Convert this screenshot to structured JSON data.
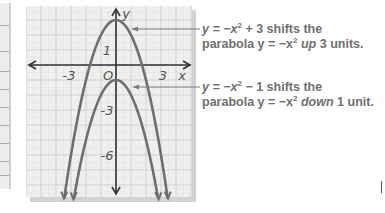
{
  "figure": {
    "axis_labels": {
      "x": "x",
      "y": "y"
    },
    "x_ticks": [
      {
        "value": -3,
        "label": "-3"
      },
      {
        "value": 0,
        "label": "O"
      },
      {
        "value": 3,
        "label": "3"
      }
    ],
    "y_ticks": [
      {
        "value": 1,
        "label": "1"
      },
      {
        "value": -3,
        "label": "-3"
      },
      {
        "value": -6,
        "label": "-6"
      }
    ],
    "colors": {
      "curve": "#6e6e6e",
      "axis": "#333333",
      "grid": "#d4d4d4",
      "grid_bg": "#efefef",
      "text": "#707070"
    }
  },
  "captions": [
    {
      "line1_pre": "y = −x",
      "line1_exp": "2",
      "line1_post": " + 3 shifts the",
      "line2_pre": "parabola y = −x",
      "line2_exp": "2",
      "line2_em": "up",
      "line2_post": " 3 units."
    },
    {
      "line1_pre": "y = −x",
      "line1_exp": "2",
      "line1_post": " − 1 shifts the",
      "line2_pre": "parabola y = −x",
      "line2_exp": "2",
      "line2_em": "down",
      "line2_post": " 1 unit."
    }
  ],
  "chart_data": {
    "type": "line",
    "title": "",
    "xlabel": "x",
    "ylabel": "y",
    "xlim": [
      -6,
      5
    ],
    "ylim": [
      -9,
      4
    ],
    "grid": true,
    "series": [
      {
        "name": "y = -x^2 + 3",
        "x": [
          -3.4,
          -3,
          -2,
          -1,
          0,
          1,
          2,
          3,
          3.4
        ],
        "y": [
          -8.56,
          -6,
          -1,
          2,
          3,
          2,
          -1,
          -6,
          -8.56
        ]
      },
      {
        "name": "y = -x^2 - 1",
        "x": [
          -2.8,
          -2,
          -1,
          0,
          1,
          2,
          2.8
        ],
        "y": [
          -8.84,
          -5,
          -2,
          -1,
          -2,
          -5,
          -8.84
        ]
      }
    ],
    "annotations": [
      "y = −x² + 3 shifts the parabola y = −x² up 3 units.",
      "y = −x² − 1 shifts the parabola y = −x² down 1 unit."
    ]
  }
}
